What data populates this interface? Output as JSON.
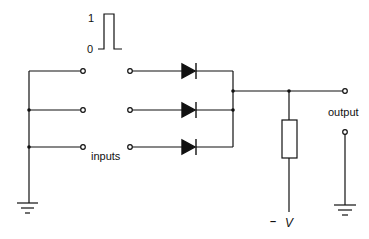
{
  "diagram": {
    "type": "diode OR gate",
    "pulse": {
      "high_label": "1",
      "low_label": "0"
    },
    "labels": {
      "inputs": "inputs",
      "output": "output",
      "supply_sign": "–",
      "supply": "V"
    },
    "inputs_count": 3,
    "colors": {
      "line": "#111111",
      "background": "#ffffff"
    }
  }
}
